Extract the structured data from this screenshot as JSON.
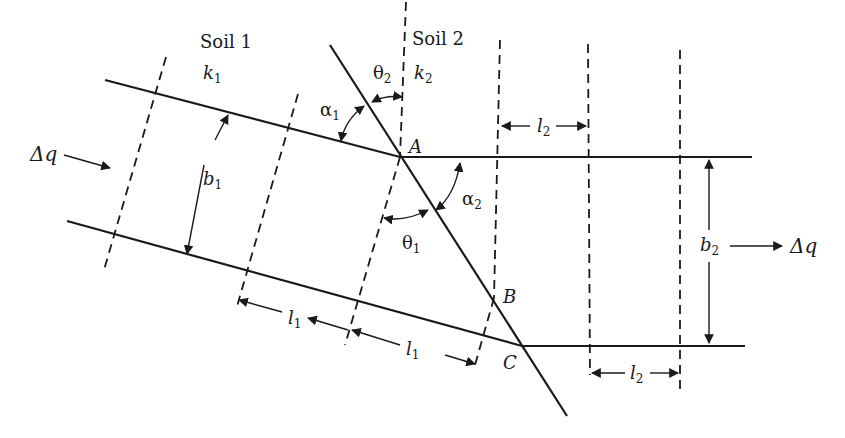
{
  "diagram": {
    "soils": [
      {
        "name": "Soil 1",
        "permeability": "k",
        "permeability_sub": "1"
      },
      {
        "name": "Soil 2",
        "permeability": "k",
        "permeability_sub": "2"
      }
    ],
    "points": {
      "A": "A",
      "B": "B",
      "C": "C"
    },
    "flow_in": "Δq",
    "flow_out": "Δq",
    "widths": {
      "b1": "b",
      "b1_sub": "1",
      "b2": "b",
      "b2_sub": "2"
    },
    "lengths": {
      "l1": "l",
      "l1_sub": "1",
      "l2": "l",
      "l2_sub": "2"
    },
    "angles": {
      "alpha1": "α",
      "alpha1_sub": "1",
      "alpha2": "α",
      "alpha2_sub": "2",
      "theta1": "θ",
      "theta1_sub": "1",
      "theta2": "θ",
      "theta2_sub": "2"
    },
    "colors": {
      "line": "#1a1a1a",
      "background": "#ffffff"
    }
  }
}
